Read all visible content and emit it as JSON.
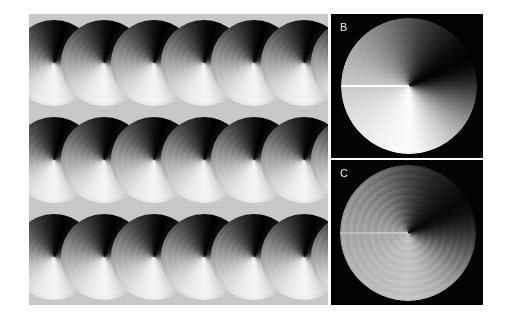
{
  "figure": {
    "width": 511,
    "height": 323,
    "background_color": "#ffffff",
    "panel_background_color": "#000000",
    "label_color": "#f2f2f2"
  },
  "panels": [
    {
      "id": "a",
      "label": "A",
      "description": "Tiled lattice of overlapping angular-gradient phase disks",
      "x": 29,
      "y": 14,
      "width": 299,
      "height": 291,
      "background_color": "#c9c9c9",
      "columns": 6,
      "rows": 3,
      "tile_width": 50,
      "tile_height": 97,
      "tile_diameter": 86
    },
    {
      "id": "b",
      "label": "B",
      "description": "Single high-contrast phase disk with hard horizontal branch cut",
      "x": 331,
      "y": 14,
      "width": 152,
      "height": 144,
      "background_color": "#000000",
      "disk_center_x": 78,
      "disk_center_y": 72,
      "disk_radius": 68,
      "branch_cut_angle_deg": 180,
      "contrast": "high"
    },
    {
      "id": "c",
      "label": "C",
      "description": "Single low-contrast phase disk with concentric ripple artifacts",
      "x": 331,
      "y": 160,
      "width": 152,
      "height": 145,
      "background_color": "#000000",
      "disk_center_x": 77,
      "disk_center_y": 73,
      "disk_radius": 68,
      "branch_cut_angle_deg": 180,
      "contrast": "low"
    }
  ],
  "chart_data": {
    "type": "heatmap",
    "title": "",
    "xlabel": "",
    "ylabel": "",
    "colormap": "grayscale",
    "value_range": [
      0,
      1
    ],
    "encoding": "angular phase ramp, 0 to 2 pi, wrapped at the branch cut",
    "panels": [
      {
        "label": "A",
        "kind": "tiled lattice",
        "grid": {
          "columns": 6,
          "rows": 3
        },
        "sweep_start_deg": 180,
        "min_gray": "#000000",
        "max_gray": "#f6f6f6",
        "ring_artifacts": true
      },
      {
        "label": "B",
        "kind": "single disk",
        "sweep_start_deg": 180,
        "min_gray": "#000000",
        "max_gray": "#ffffff",
        "ring_artifacts": false
      },
      {
        "label": "C",
        "kind": "single disk",
        "sweep_start_deg": 180,
        "min_gray": "#060606",
        "max_gray": "#c6c6c6",
        "ring_artifacts": true
      }
    ]
  }
}
